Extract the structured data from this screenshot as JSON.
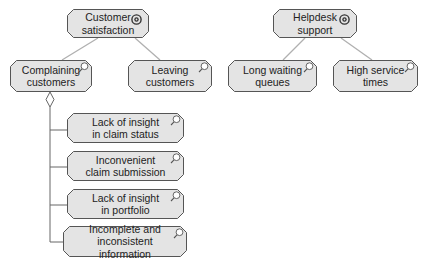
{
  "diagram": {
    "colors": {
      "fill": "#e4e4e4",
      "stroke": "#555555",
      "link": "#b0b0b0",
      "aggregation": "#666666"
    },
    "nodes": [
      {
        "id": "customer-satisfaction",
        "label": "Customer\nsatisfaction",
        "icon": "goal-icon",
        "x": 67,
        "y": 9,
        "w": 82,
        "h": 29
      },
      {
        "id": "complaining-customers",
        "label": "Complaining\ncustomers",
        "icon": "magnifier-icon",
        "x": 10,
        "y": 60,
        "w": 82,
        "h": 32
      },
      {
        "id": "leaving-customers",
        "label": "Leaving\ncustomers",
        "icon": "magnifier-icon",
        "x": 128,
        "y": 60,
        "w": 84,
        "h": 32
      },
      {
        "id": "helpdesk-support",
        "label": "Helpdesk\nsupport",
        "icon": "goal-icon",
        "x": 273,
        "y": 9,
        "w": 84,
        "h": 29
      },
      {
        "id": "long-waiting-queues",
        "label": "Long waiting\nqueues",
        "icon": "magnifier-icon",
        "x": 228,
        "y": 60,
        "w": 89,
        "h": 32
      },
      {
        "id": "high-service-times",
        "label": "High service\ntimes",
        "icon": "magnifier-icon",
        "x": 333,
        "y": 60,
        "w": 85,
        "h": 32
      },
      {
        "id": "lack-insight-claim-status",
        "label": "Lack of insight\nin claim status",
        "icon": "magnifier-icon",
        "x": 67,
        "y": 113,
        "w": 117,
        "h": 30
      },
      {
        "id": "inconvenient-claim-submission",
        "label": "Inconvenient\nclaim submission",
        "icon": "magnifier-icon",
        "x": 67,
        "y": 151,
        "w": 117,
        "h": 30
      },
      {
        "id": "lack-insight-portfolio",
        "label": "Lack of insight\nin portfolio",
        "icon": "magnifier-icon",
        "x": 67,
        "y": 189,
        "w": 117,
        "h": 30
      },
      {
        "id": "incomplete-inconsistent-information",
        "label": "Incomplete and\ninconsistent information",
        "icon": "magnifier-icon",
        "x": 63,
        "y": 226,
        "w": 124,
        "h": 31
      }
    ],
    "links": [
      {
        "from": "customer-satisfaction",
        "to": "complaining-customers",
        "x1": 98,
        "y1": 38,
        "x2": 62,
        "y2": 60
      },
      {
        "from": "customer-satisfaction",
        "to": "leaving-customers",
        "x1": 135,
        "y1": 38,
        "x2": 160,
        "y2": 60
      },
      {
        "from": "helpdesk-support",
        "to": "long-waiting-queues",
        "x1": 305,
        "y1": 38,
        "x2": 283,
        "y2": 60
      },
      {
        "from": "helpdesk-support",
        "to": "high-service-times",
        "x1": 341,
        "y1": 38,
        "x2": 372,
        "y2": 60
      }
    ],
    "aggregation": {
      "from": "complaining-customers",
      "diamond": {
        "cx": 50,
        "top": 92,
        "bottom": 107,
        "half_width": 4
      },
      "trunk_x": 50,
      "branch_ys": [
        130,
        167,
        205,
        242
      ],
      "children": [
        "lack-insight-claim-status",
        "inconvenient-claim-submission",
        "lack-insight-portfolio",
        "incomplete-inconsistent-information"
      ]
    }
  }
}
